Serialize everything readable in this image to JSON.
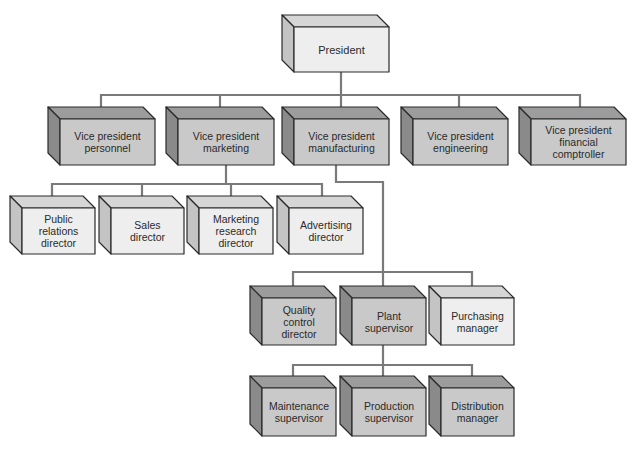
{
  "diagram": {
    "type": "org-chart",
    "colors": {
      "connector": "#7a7a7a",
      "outline": "#2a2a2a",
      "light_front": "#eeeeee",
      "light_top": "#d6d6d6",
      "light_side": "#c4c4c4",
      "dark_front": "#c9c9c9",
      "dark_top": "#9c9c9c",
      "dark_side": "#8a8a8a",
      "text": "#2a2a2a"
    },
    "nodes": [
      {
        "id": "president",
        "label": "President",
        "parent": null,
        "shade": "light",
        "x": 294,
        "y": 27,
        "w": 95,
        "h": 45
      },
      {
        "id": "vp-personnel",
        "label": "Vice president\npersonnel",
        "parent": "president",
        "shade": "dark",
        "x": 60,
        "y": 119,
        "w": 95,
        "h": 46
      },
      {
        "id": "vp-marketing",
        "label": "Vice president\nmarketing",
        "parent": "president",
        "shade": "dark",
        "x": 178,
        "y": 119,
        "w": 96,
        "h": 46
      },
      {
        "id": "vp-manufacturing",
        "label": "Vice president\nmanufacturing",
        "parent": "president",
        "shade": "dark",
        "x": 294,
        "y": 119,
        "w": 95,
        "h": 46
      },
      {
        "id": "vp-engineering",
        "label": "Vice president\nengineering",
        "parent": "president",
        "shade": "dark",
        "x": 413,
        "y": 119,
        "w": 95,
        "h": 46
      },
      {
        "id": "vp-financial",
        "label": "Vice president\nfinancial\ncomptroller",
        "parent": "president",
        "shade": "dark",
        "x": 531,
        "y": 119,
        "w": 95,
        "h": 46
      },
      {
        "id": "public-relations",
        "label": "Public\nrelations\ndirector",
        "parent": "vp-marketing",
        "shade": "light",
        "x": 22,
        "y": 208,
        "w": 73,
        "h": 46
      },
      {
        "id": "sales",
        "label": "Sales\ndirector",
        "parent": "vp-marketing",
        "shade": "light",
        "x": 111,
        "y": 208,
        "w": 73,
        "h": 46
      },
      {
        "id": "marketing-research",
        "label": "Marketing\nresearch\ndirector",
        "parent": "vp-marketing",
        "shade": "light",
        "x": 199,
        "y": 208,
        "w": 74,
        "h": 46
      },
      {
        "id": "advertising",
        "label": "Advertising\ndirector",
        "parent": "vp-marketing",
        "shade": "light",
        "x": 289,
        "y": 208,
        "w": 74,
        "h": 46
      },
      {
        "id": "quality-control",
        "label": "Quality\ncontrol\ndirector",
        "parent": "vp-manufacturing",
        "shade": "dark",
        "x": 262,
        "y": 298,
        "w": 74,
        "h": 47
      },
      {
        "id": "plant-supervisor",
        "label": "Plant\nsupervisor",
        "parent": "vp-manufacturing",
        "shade": "dark",
        "x": 352,
        "y": 298,
        "w": 74,
        "h": 47
      },
      {
        "id": "purchasing",
        "label": "Purchasing\nmanager",
        "parent": "vp-manufacturing",
        "shade": "light",
        "x": 441,
        "y": 298,
        "w": 73,
        "h": 47
      },
      {
        "id": "maintenance",
        "label": "Maintenance\nsupervisor",
        "parent": "plant-supervisor",
        "shade": "dark",
        "x": 262,
        "y": 388,
        "w": 74,
        "h": 48
      },
      {
        "id": "production",
        "label": "Production\nsupervisor",
        "parent": "plant-supervisor",
        "shade": "dark",
        "x": 352,
        "y": 388,
        "w": 74,
        "h": 48
      },
      {
        "id": "distribution",
        "label": "Distribution\nmanager",
        "parent": "plant-supervisor",
        "shade": "dark",
        "x": 441,
        "y": 388,
        "w": 73,
        "h": 48
      }
    ],
    "connectors": [
      {
        "from": "president",
        "points": [
          [
            341,
            72
          ],
          [
            341,
            95
          ]
        ]
      },
      {
        "from": "president",
        "points": [
          [
            101,
            113
          ],
          [
            101,
            95
          ],
          [
            580,
            95
          ],
          [
            580,
            113
          ]
        ]
      },
      {
        "from": "president",
        "points": [
          [
            220,
            95
          ],
          [
            220,
            113
          ]
        ]
      },
      {
        "from": "president",
        "points": [
          [
            341,
            95
          ],
          [
            341,
            113
          ]
        ]
      },
      {
        "from": "president",
        "points": [
          [
            459,
            95
          ],
          [
            459,
            113
          ]
        ]
      },
      {
        "from": "vp-marketing",
        "points": [
          [
            226,
            165
          ],
          [
            226,
            184
          ]
        ]
      },
      {
        "from": "vp-marketing",
        "points": [
          [
            52,
            202
          ],
          [
            52,
            184
          ],
          [
            322,
            184
          ],
          [
            322,
            202
          ]
        ]
      },
      {
        "from": "vp-marketing",
        "points": [
          [
            142,
            184
          ],
          [
            142,
            202
          ]
        ]
      },
      {
        "from": "vp-marketing",
        "points": [
          [
            231,
            184
          ],
          [
            231,
            202
          ]
        ]
      },
      {
        "from": "vp-manufacturing",
        "points": [
          [
            336,
            165
          ],
          [
            336,
            182
          ],
          [
            383,
            182
          ],
          [
            383,
            293
          ]
        ]
      },
      {
        "from": "vp-manufacturing",
        "points": [
          [
            293,
            292
          ],
          [
            293,
            272
          ],
          [
            472,
            272
          ],
          [
            472,
            292
          ]
        ]
      },
      {
        "from": "plant-supervisor",
        "points": [
          [
            383,
            345
          ],
          [
            383,
            382
          ]
        ]
      },
      {
        "from": "plant-supervisor",
        "points": [
          [
            293,
            382
          ],
          [
            293,
            365
          ],
          [
            472,
            365
          ],
          [
            472,
            382
          ]
        ]
      }
    ],
    "depth": 12
  }
}
